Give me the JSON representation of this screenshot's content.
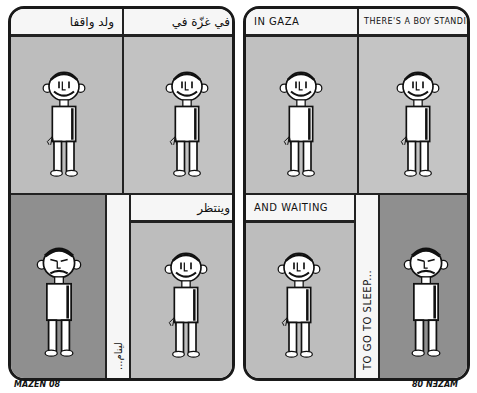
{
  "comic": {
    "title": "In Gaza there's a boy standing and waiting to go to sleep",
    "colors": {
      "ink": "#1a1a1a",
      "paper": "#f6f6f6",
      "panel_light": "#bdbdbd",
      "panel_dark": "#8f8f8f"
    },
    "left_page": {
      "language": "Arabic",
      "top_row": [
        {
          "caption": "ولد واقفا",
          "mood": "smiling",
          "bg": "light"
        },
        {
          "caption": "في غزّة في",
          "mood": "smiling",
          "bg": "light"
        }
      ],
      "bottom_row": [
        {
          "caption": "",
          "mood": "sad",
          "bg": "dark"
        },
        {
          "vertical_caption": "لينام...",
          "mood": "none"
        },
        {
          "caption": "وينتظر",
          "mood": "smiling",
          "bg": "light"
        }
      ]
    },
    "right_page": {
      "language": "English",
      "top_row": [
        {
          "caption": "IN GAZA",
          "mood": "smiling",
          "bg": "light"
        },
        {
          "caption": "THERE'S A BOY STANDING",
          "mood": "smiling",
          "bg": "light"
        }
      ],
      "bottom_row": [
        {
          "caption": "AND WAITING",
          "mood": "smiling",
          "bg": "light"
        },
        {
          "vertical_caption": "TO GO TO SLEEP...",
          "mood": "none"
        },
        {
          "caption": "",
          "mood": "sad",
          "bg": "dark"
        }
      ]
    },
    "signatures": {
      "left": "MAZEN 08",
      "right": "80 NƎZAM"
    }
  }
}
